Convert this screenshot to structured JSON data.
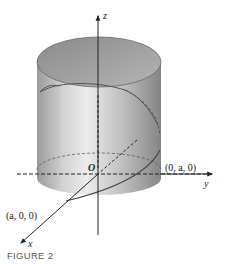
{
  "figure": {
    "caption": "FIGURE 2",
    "axes": {
      "z_label": "z",
      "y_label": "y",
      "x_label": "x",
      "origin_label": "O"
    },
    "points": {
      "y_intercept": "(0, a, 0)",
      "x_intercept": "(a, 0, 0)"
    },
    "colors": {
      "cylinder_light": "#e6e6e6",
      "cylinder_dark": "#8c8c8c",
      "top_inner": "#a8a8a8",
      "lines": "#333333"
    }
  }
}
